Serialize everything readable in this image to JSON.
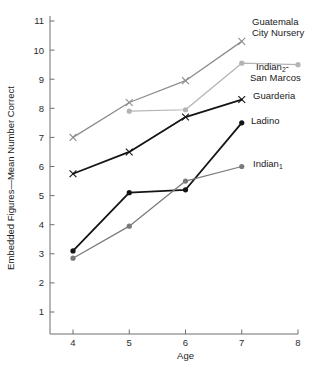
{
  "chart_data": {
    "type": "line",
    "title": "",
    "xlabel": "Age",
    "ylabel": "Embedded Figures—Mean Number Correct",
    "xlim": [
      3.6,
      8.2
    ],
    "ylim": [
      0.3,
      11.3
    ],
    "xticks": [
      "4",
      "5",
      "6",
      "7",
      "8"
    ],
    "xtick_values": [
      4,
      5,
      6,
      7,
      8
    ],
    "yticks": [
      "1",
      "2",
      "3",
      "4",
      "5",
      "6",
      "7",
      "8",
      "9",
      "10",
      "11"
    ],
    "ytick_values": [
      1,
      2,
      3,
      4,
      5,
      6,
      7,
      8,
      9,
      10,
      11
    ],
    "grid": false,
    "legend_position": "right-inline-annotations",
    "series": [
      {
        "name": "Guatemala City Nursery",
        "label_line1": "Guatemala",
        "label_line2": "City Nursery",
        "marker": "x",
        "color": "#8c8c8c",
        "x": [
          4,
          5,
          6,
          7
        ],
        "values": [
          7.0,
          8.2,
          8.95,
          10.3
        ]
      },
      {
        "name": "Indian2 - San Marcos",
        "label_line1": "Indian",
        "label_sub": "2",
        "label_line1_tail": "-",
        "label_line2": "San Marcos",
        "marker": "dot",
        "color": "#b4b4b4",
        "x": [
          5,
          6,
          7,
          8
        ],
        "values": [
          7.9,
          7.95,
          9.55,
          9.5
        ]
      },
      {
        "name": "Guarderia",
        "label_line1": "Guarderia",
        "marker": "x",
        "color": "#141414",
        "x": [
          4,
          5,
          6,
          7
        ],
        "values": [
          5.75,
          6.5,
          7.7,
          8.3
        ]
      },
      {
        "name": "Ladino",
        "label_line1": "Ladino",
        "marker": "dot",
        "color": "#141414",
        "x": [
          4,
          5,
          6,
          7
        ],
        "values": [
          3.1,
          5.1,
          5.2,
          7.5
        ]
      },
      {
        "name": "Indian1",
        "label_line1": "Indian",
        "label_sub": "1",
        "marker": "dot",
        "color": "#7a7a7a",
        "x": [
          4,
          5,
          6,
          7
        ],
        "values": [
          2.85,
          3.95,
          5.5,
          6.0
        ]
      }
    ],
    "annotations": [
      {
        "text": "Guatemala",
        "x": 264,
        "y": 22
      },
      {
        "text": "City Nursery",
        "x": 264,
        "y": 33
      },
      {
        "text": "Indian",
        "x": 262,
        "y": 69
      },
      {
        "text": "San Marcos",
        "x": 258,
        "y": 80
      },
      {
        "text": "Guarderia",
        "x": 259,
        "y": 100
      },
      {
        "text": "Ladino",
        "x": 255,
        "y": 122
      },
      {
        "text": "Indian",
        "x": 256,
        "y": 165
      }
    ]
  },
  "axes": {
    "x_title": "Age",
    "y_title": "Embedded Figures—Mean Number Correct"
  },
  "colors": {
    "guatemala": "#8c8c8c",
    "indian2": "#b4b4b4",
    "guarderia": "#141414",
    "ladino": "#141414",
    "indian1": "#7a7a7a",
    "axis": "#6e6e6e",
    "text": "#1a1a1a",
    "background": "#ffffff"
  }
}
